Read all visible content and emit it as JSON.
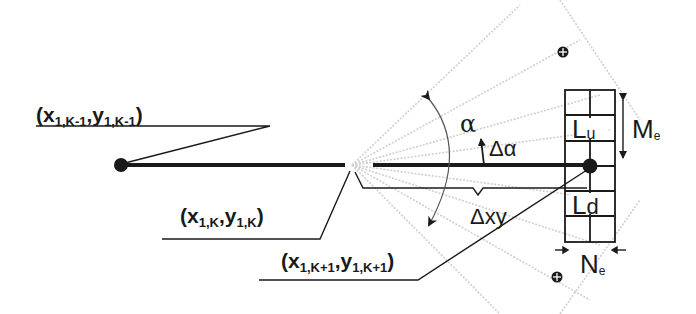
{
  "diagram": {
    "points": {
      "previous": {
        "label_main_x": "(x",
        "label_sub_x": "1,K-1",
        "label_sep": ",y",
        "label_sub_y": "1,K-1",
        "label_close": ")"
      },
      "current": {
        "label_main_x": "(x",
        "label_sub_x": "1,K",
        "label_sep": ",y",
        "label_sub_y": "1,K",
        "label_close": ")"
      },
      "next": {
        "label_main_x": "(x",
        "label_sub_x": "1,K+1",
        "label_sep": ",y",
        "label_sub_y": "1,K+1",
        "label_close": ")"
      }
    },
    "angle": {
      "alpha": "α",
      "delta_alpha": "Δα"
    },
    "distance": {
      "delta_xy": "Δxy"
    },
    "window": {
      "upper_cell": {
        "main": "L",
        "sub": "u"
      },
      "lower_cell": {
        "main": "L",
        "sub": "d"
      },
      "height_label": {
        "main": "M",
        "sub": "e"
      },
      "width_label": {
        "main": "N",
        "sub": "e"
      }
    },
    "colors": {
      "ink": "#1a1a1a",
      "fan": "#c8c8c8",
      "background": "#ffffff"
    }
  }
}
